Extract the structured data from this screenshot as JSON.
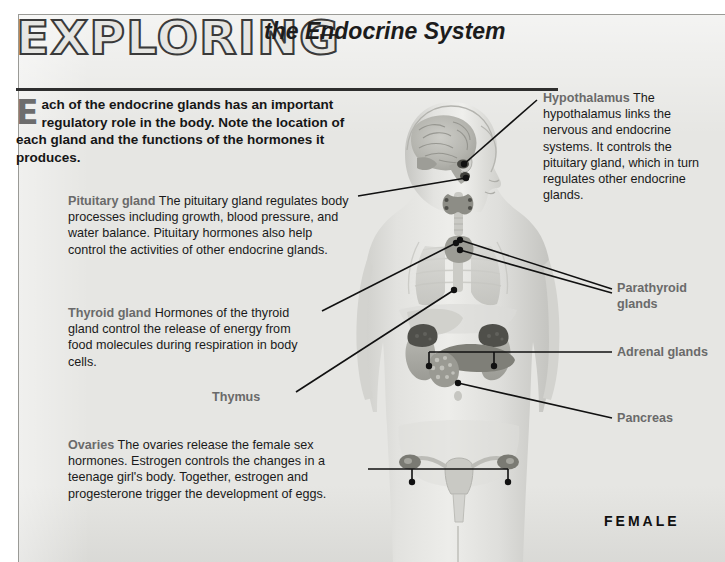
{
  "poster": {
    "title_script": "EXPLORING",
    "title_sub": "the Endocrine System",
    "intro_dropcap": "E",
    "intro_text": "ach of the endocrine glands has an important regulatory role in the body. Note the location of each gland and the functions of the hormones it produces.",
    "sex_label": "FEMALE",
    "colors": {
      "panel_background": "#e6e6e3",
      "page_background": "#ffffff",
      "heading_gray": "#6a6a6a",
      "body_text": "#1a1a1a",
      "rule": "#2e2e2e",
      "leader_line": "#111111"
    }
  },
  "callouts": {
    "pituitary": {
      "heading": "Pituitary gland",
      "body": "The pituitary gland regulates body processes including growth, blood pressure, and water balance. Pituitary hormones also help control the activities of other endocrine glands."
    },
    "thyroid": {
      "heading": "Thyroid gland",
      "body": "Hormones of the thyroid gland control the release of energy from food molecules during respiration in body cells."
    },
    "thymus": {
      "heading": "Thymus",
      "body": ""
    },
    "ovaries": {
      "heading": "Ovaries",
      "body": "The ovaries release the female sex hormones. Estrogen controls the changes in a teenage girl's body. Together, estrogen and progesterone trigger the development of eggs."
    },
    "hypothalamus": {
      "heading": "Hypothalamus",
      "body": "The hypothalamus links the nervous and endocrine systems. It controls the pituitary gland, which in turn regulates other endocrine glands."
    },
    "parathyroid": {
      "heading": "Parathyroid glands",
      "body": ""
    },
    "adrenal": {
      "heading": "Adrenal glands",
      "body": ""
    },
    "pancreas": {
      "heading": "Pancreas",
      "body": ""
    }
  },
  "figure": {
    "glands": [
      "hypothalamus",
      "pituitary gland",
      "thyroid gland",
      "parathyroid glands",
      "thymus",
      "adrenal glands",
      "pancreas",
      "ovaries"
    ]
  }
}
